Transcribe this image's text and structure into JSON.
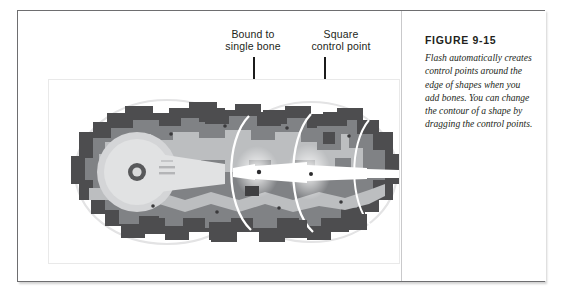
{
  "figure": {
    "title": "FIGURE 9-15",
    "caption": "Flash automatically creates control points around the edge of shapes when you add bones. You can change the contour of a shape by dragging the control points."
  },
  "annotations": [
    {
      "id": "bound-to-single-bone",
      "label": "Bound to\nsingle bone",
      "line1": "Bound to",
      "line2": "single bone"
    },
    {
      "id": "square-control-point",
      "label": "Square\ncontrol point",
      "line1": "Square",
      "line2": "control point"
    }
  ],
  "illustration": {
    "name": "gear-shape-with-bones-and-control-points",
    "description": "Grayscale vector illustration of two interlocking cogwheel/robot shapes with an IK bone chain and square control points",
    "colors": {
      "outline_dark": "#4d4d4f",
      "body_mid": "#808285",
      "body_light": "#bcbec0",
      "highlight": "#e6e7e8",
      "bone_white": "#ffffff",
      "page_background": "#ffffff",
      "frame_border": "#6e6e70",
      "inner_frame_border": "#e9e9e9",
      "text": "#231f20",
      "leader_line": "#1b1b1b"
    }
  }
}
